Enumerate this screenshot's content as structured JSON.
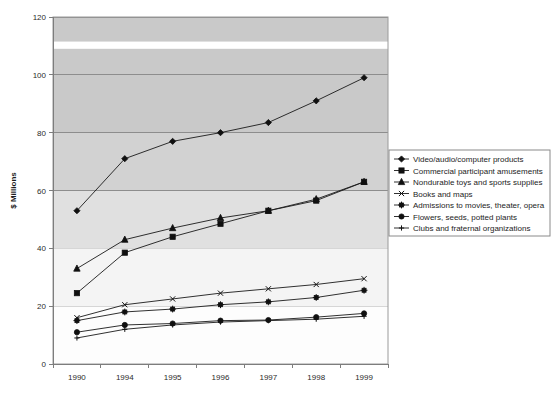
{
  "chart_data": {
    "type": "line",
    "title": "",
    "xlabel": "",
    "ylabel": "$ Millions",
    "categories": [
      "1990",
      "1994",
      "1995",
      "1996",
      "1997",
      "1998",
      "1999"
    ],
    "ylim": [
      0,
      120
    ],
    "yticks": [
      0,
      20,
      40,
      60,
      80,
      100,
      120
    ],
    "grid": true,
    "legend_position": "right",
    "series": [
      {
        "name": "Video/audio/computer products",
        "marker": "diamond",
        "values": [
          53,
          71,
          77,
          80,
          83.5,
          91,
          99
        ]
      },
      {
        "name": "Commercial participant amusements",
        "marker": "square",
        "values": [
          24.5,
          38.5,
          44,
          48.5,
          53,
          56.5,
          63
        ]
      },
      {
        "name": "Nondurable toys and sports supplies",
        "marker": "triangle",
        "values": [
          33,
          43,
          47,
          50.5,
          53,
          57,
          63
        ]
      },
      {
        "name": "Books and maps",
        "marker": "x",
        "values": [
          16,
          20.5,
          22.5,
          24.5,
          26,
          27.5,
          29.5
        ]
      },
      {
        "name": "Admissions to movies, theater, opera",
        "marker": "star",
        "values": [
          15,
          18,
          19,
          20.5,
          21.5,
          23,
          25.5
        ]
      },
      {
        "name": "Flowers, seeds, potted plants",
        "marker": "circle",
        "values": [
          11,
          13.5,
          14,
          15,
          15.2,
          16.2,
          17.5
        ]
      },
      {
        "name": "Clubs and fraternal organizations",
        "marker": "plus",
        "values": [
          9,
          12,
          13.5,
          14.5,
          15,
          15.5,
          16.5
        ]
      }
    ]
  },
  "colors": {
    "series": "#101010",
    "plot_band_dark": "#c9c9c9",
    "plot_band_mid": "#d9d9d9",
    "plot_band_light": "#ededed",
    "gridline": "#8d8d8d",
    "legend_border": "#8a8a8a",
    "background": "#ffffff"
  }
}
